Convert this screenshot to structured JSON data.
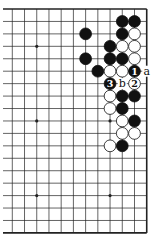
{
  "diagram": {
    "type": "go-board-fragment",
    "grid": {
      "cols": 12,
      "rows": 19,
      "x0": 12.3,
      "y0": 9,
      "dx": 12.22,
      "dy": 12.44,
      "left_extend": 3
    },
    "edges": {
      "top": true,
      "bottom": true,
      "right": true,
      "left": false
    },
    "star_points": [
      [
        2,
        3
      ],
      [
        2,
        9
      ],
      [
        8,
        9
      ],
      [
        2,
        15
      ],
      [
        8,
        15
      ]
    ],
    "stones": [
      {
        "col": 9,
        "row": 1,
        "color": "black"
      },
      {
        "col": 10,
        "row": 1,
        "color": "black"
      },
      {
        "col": 6,
        "row": 2,
        "color": "black"
      },
      {
        "col": 9,
        "row": 2,
        "color": "black"
      },
      {
        "col": 10,
        "row": 2,
        "color": "white"
      },
      {
        "col": 8,
        "row": 3,
        "color": "black"
      },
      {
        "col": 9,
        "row": 3,
        "color": "white"
      },
      {
        "col": 10,
        "row": 3,
        "color": "white"
      },
      {
        "col": 6,
        "row": 4,
        "color": "black"
      },
      {
        "col": 8,
        "row": 4,
        "color": "black"
      },
      {
        "col": 9,
        "row": 4,
        "color": "black"
      },
      {
        "col": 10,
        "row": 4,
        "color": "white"
      },
      {
        "col": 7,
        "row": 5,
        "color": "black"
      },
      {
        "col": 8,
        "row": 5,
        "color": "white"
      },
      {
        "col": 9,
        "row": 5,
        "color": "white"
      },
      {
        "col": 10,
        "row": 5,
        "color": "black",
        "label": "1"
      },
      {
        "col": 8,
        "row": 6,
        "color": "black",
        "label": "3"
      },
      {
        "col": 10,
        "row": 6,
        "color": "white",
        "label": "2"
      },
      {
        "col": 8,
        "row": 7,
        "color": "white"
      },
      {
        "col": 9,
        "row": 7,
        "color": "black"
      },
      {
        "col": 10,
        "row": 7,
        "color": "black"
      },
      {
        "col": 8,
        "row": 8,
        "color": "white"
      },
      {
        "col": 9,
        "row": 8,
        "color": "black"
      },
      {
        "col": 9,
        "row": 9,
        "color": "white"
      },
      {
        "col": 10,
        "row": 9,
        "color": "black"
      },
      {
        "col": 9,
        "row": 10,
        "color": "white"
      },
      {
        "col": 10,
        "row": 10,
        "color": "white"
      },
      {
        "col": 8,
        "row": 11,
        "color": "white"
      },
      {
        "col": 9,
        "row": 11,
        "color": "black"
      }
    ],
    "point_labels": [
      {
        "col": 11,
        "row": 5,
        "text": "a"
      },
      {
        "col": 9,
        "row": 6,
        "text": "b"
      }
    ],
    "colors": {
      "line": "#222222",
      "black": "#111111",
      "white": "#ffffff",
      "background": "#ffffff"
    }
  }
}
